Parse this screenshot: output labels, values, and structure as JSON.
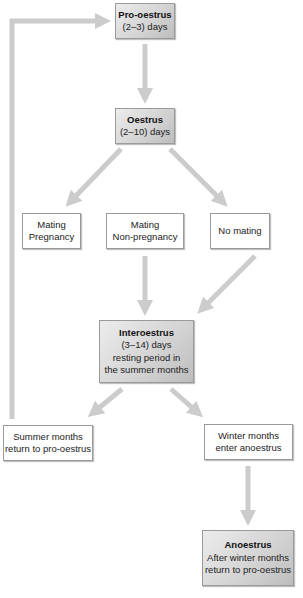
{
  "diagram": {
    "colors": {
      "arrow": "#cccccc",
      "box_border": "#9a9a9a",
      "shaded_box": "#d2d2d2",
      "plain_box": "#ffffff"
    },
    "nodes": {
      "pro_oestrus": {
        "title": "Pro-oestrus",
        "lines": [
          "(2–3) days"
        ]
      },
      "oestrus": {
        "title": "Oestrus",
        "lines": [
          "(2–10) days"
        ]
      },
      "mating_pregnancy": {
        "lines": [
          "Mating",
          "Pregnancy"
        ]
      },
      "mating_non_pregnancy": {
        "lines": [
          "Mating",
          "Non-pregnancy"
        ]
      },
      "no_mating": {
        "lines": [
          "No mating"
        ]
      },
      "interoestrus": {
        "title": "Interoestrus",
        "lines": [
          "(3–14) days",
          "resting period in",
          "the summer months"
        ]
      },
      "summer_months": {
        "lines": [
          "Summer months",
          "return to pro-oestrus"
        ]
      },
      "winter_months": {
        "lines": [
          "Winter months",
          "enter anoestrus"
        ]
      },
      "anoestrus": {
        "title": "Anoestrus",
        "lines": [
          "After winter months",
          "return to pro-oestrus"
        ]
      }
    },
    "edges": [
      {
        "from": "pro_oestrus",
        "to": "oestrus"
      },
      {
        "from": "oestrus",
        "to": "mating_pregnancy"
      },
      {
        "from": "oestrus",
        "to": "no_mating"
      },
      {
        "from": "mating_non_pregnancy",
        "to": "interoestrus"
      },
      {
        "from": "no_mating",
        "to": "interoestrus"
      },
      {
        "from": "interoestrus",
        "to": "summer_months"
      },
      {
        "from": "interoestrus",
        "to": "winter_months"
      },
      {
        "from": "winter_months",
        "to": "anoestrus"
      },
      {
        "from": "summer_months",
        "to": "pro_oestrus"
      }
    ]
  }
}
